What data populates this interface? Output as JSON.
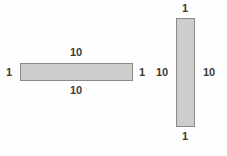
{
  "figure": {
    "background_color": "#fefefe",
    "shape_fill_color": "#cdcdcd",
    "shape_border_color": "#8a8a8a",
    "label_color": "#3b3b3b"
  },
  "shapes": [
    {
      "name": "horizontal-rectangle",
      "orientation": "horizontal",
      "labels": {
        "top": "10",
        "bottom": "10",
        "left": "1",
        "right": "1"
      }
    },
    {
      "name": "vertical-rectangle",
      "orientation": "vertical",
      "labels": {
        "top": "1",
        "bottom": "1",
        "left": "10",
        "right": "10"
      }
    }
  ]
}
